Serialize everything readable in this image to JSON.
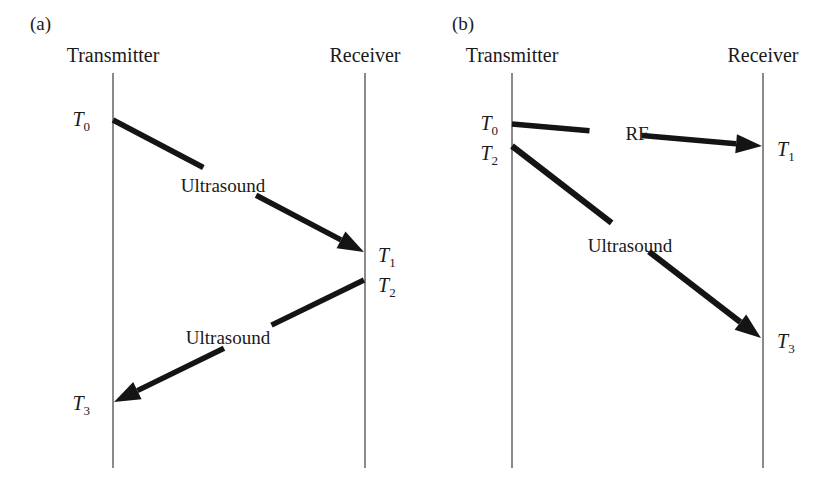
{
  "figure": {
    "background_color": "#ffffff",
    "ink_color": "#141414",
    "axis_color": "#6d6d6d",
    "width": 831,
    "height": 496
  },
  "panels": [
    {
      "tag": "(a)",
      "tag_x": 30,
      "tag_y": 30,
      "transmitter": {
        "label": "Transmitter",
        "label_x": 113,
        "label_y": 62,
        "line_x": 113,
        "line_y1": 73,
        "line_y2": 468
      },
      "receiver": {
        "label": "Receiver",
        "label_x": 365,
        "label_y": 62,
        "line_x": 365,
        "line_y1": 73,
        "line_y2": 468
      },
      "rays": [
        {
          "label": "Ultrasound",
          "label_x": 223,
          "label_y": 192,
          "x1": 113,
          "y1": 120,
          "x2": 364,
          "y2": 252,
          "gap_start": 0.36,
          "gap_end": 0.57,
          "thickness": 5.5,
          "arrow": "end"
        },
        {
          "label": "Ultrasound",
          "label_x": 228,
          "label_y": 344,
          "x1": 364,
          "y1": 280,
          "x2": 114,
          "y2": 402,
          "gap_start": 0.37,
          "gap_end": 0.56,
          "thickness": 5.5,
          "arrow": "end"
        }
      ],
      "time_markers": [
        {
          "base": "T",
          "sub": "0",
          "x": 90,
          "y": 126,
          "anchor": "end"
        },
        {
          "base": "T",
          "sub": "1",
          "x": 378,
          "y": 262,
          "anchor": "start"
        },
        {
          "base": "T",
          "sub": "2",
          "x": 378,
          "y": 292,
          "anchor": "start"
        },
        {
          "base": "T",
          "sub": "3",
          "x": 90,
          "y": 410,
          "anchor": "end"
        }
      ]
    },
    {
      "tag": "(b)",
      "tag_x": 452,
      "tag_y": 30,
      "transmitter": {
        "label": "Transmitter",
        "label_x": 512,
        "label_y": 62,
        "line_x": 512,
        "line_y1": 73,
        "line_y2": 468
      },
      "receiver": {
        "label": "Receiver",
        "label_x": 763,
        "label_y": 62,
        "line_x": 763,
        "line_y1": 73,
        "line_y2": 468
      },
      "rays": [
        {
          "label": "RF",
          "label_x": 637,
          "label_y": 140,
          "x1": 512,
          "y1": 124,
          "x2": 762,
          "y2": 146,
          "gap_start": 0.31,
          "gap_end": 0.52,
          "thickness": 5.5,
          "arrow": "end"
        },
        {
          "label": "Ultrasound",
          "label_x": 630,
          "label_y": 252,
          "x1": 512,
          "y1": 146,
          "x2": 761,
          "y2": 338,
          "gap_start": 0.4,
          "gap_end": 0.55,
          "thickness": 6,
          "arrow": "end"
        }
      ],
      "time_markers": [
        {
          "base": "T",
          "sub": "0",
          "x": 498,
          "y": 130,
          "anchor": "end"
        },
        {
          "base": "T",
          "sub": "2",
          "x": 498,
          "y": 160,
          "anchor": "end"
        },
        {
          "base": "T",
          "sub": "1",
          "x": 777,
          "y": 156,
          "anchor": "start"
        },
        {
          "base": "T",
          "sub": "3",
          "x": 777,
          "y": 348,
          "anchor": "start"
        }
      ]
    }
  ]
}
